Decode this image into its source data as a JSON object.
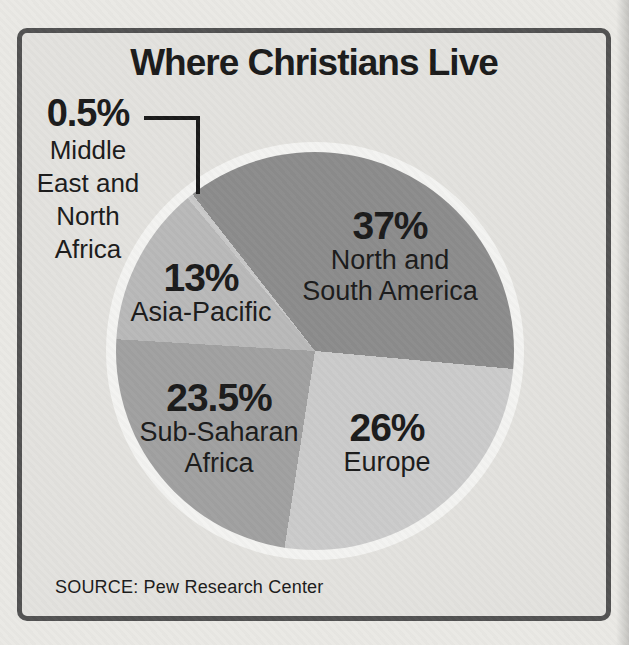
{
  "page": {
    "background_color": "#eae9e5",
    "panel_background_color": "#e3e2de",
    "border_color": "#525252",
    "text_color": "#1b1b1b"
  },
  "chart_data": {
    "type": "pie",
    "title": "Where Christians Live",
    "source_label": "SOURCE: Pew Research Center",
    "direction": "clockwise",
    "start_angle_from_top_deg": -38,
    "ring_color": "#f3f3f1",
    "legend_position": "labels-on-slices",
    "slices": [
      {
        "label": "North and South America",
        "value": 37,
        "display_value": "37%",
        "label_lines": [
          "North and",
          "South America"
        ],
        "color": "#8c8c8c"
      },
      {
        "label": "Europe",
        "value": 26,
        "display_value": "26%",
        "label_lines": [
          "Europe"
        ],
        "color": "#cbcbcb"
      },
      {
        "label": "Sub-Saharan Africa",
        "value": 23.5,
        "display_value": "23.5%",
        "label_lines": [
          "Sub-Saharan",
          "Africa"
        ],
        "color": "#a1a1a1"
      },
      {
        "label": "Asia-Pacific",
        "value": 13,
        "display_value": "13%",
        "label_lines": [
          "Asia-Pacific"
        ],
        "color": "#b9b9b9"
      },
      {
        "label": "Middle East and North Africa",
        "value": 0.5,
        "display_value": "0.5%",
        "label_lines": [
          "Middle",
          "East and",
          "North",
          "Africa"
        ],
        "color": "#c9c9c9"
      }
    ]
  }
}
